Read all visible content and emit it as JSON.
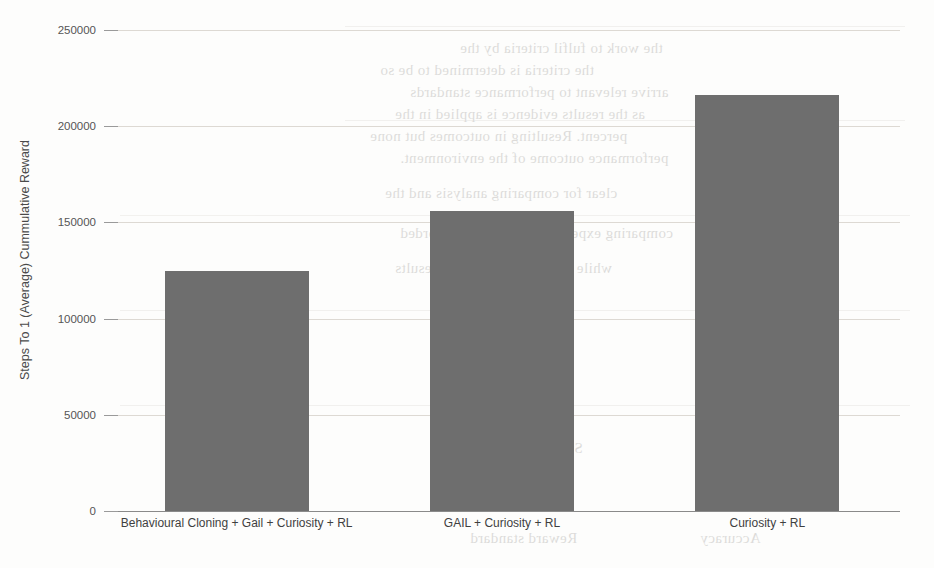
{
  "chart_data": {
    "type": "bar",
    "title": "",
    "xlabel": "",
    "ylabel": "Steps To 1 (Average) Cummulative Reward",
    "categories": [
      "Behavioural Cloning + Gail + Curiosity + RL",
      "GAIL + Curiosity + RL",
      "Curiosity + RL"
    ],
    "values": [
      125000,
      156000,
      216000
    ],
    "ylim": [
      0,
      250000
    ],
    "yticks": [
      0,
      50000,
      100000,
      150000,
      200000,
      250000
    ],
    "ytick_labels": [
      "0",
      "50000",
      "100000",
      "150000",
      "200000",
      "250000"
    ],
    "grid": true,
    "legend": "none",
    "bar_color": "#6e6e6e",
    "grid_color": "#ddd9d3",
    "axis_color": "#8a8a8a"
  },
  "scan_artifacts": {
    "description": "faint mirrored bleed-through text from the reverse side of the scanned page",
    "lines": [
      "the work to fulfil criteria by the",
      "the criteria is determined to be so",
      "arrive relevant to performance standards",
      "as the results evidence is applied in the",
      "percent. Resulting in outcomes but none",
      "performance outcome of the environment.",
      "clear for comparing analysis and the",
      "comparing experiments primarily recorded",
      "while recorded experiment results",
      "Table",
      "Results",
      "Metric",
      "Step count",
      "Reward standard",
      "Accuracy"
    ]
  }
}
